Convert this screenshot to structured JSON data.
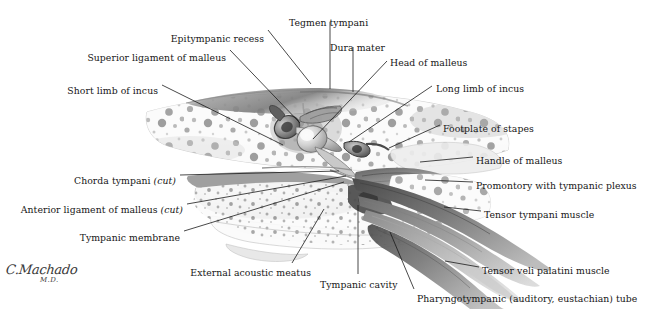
{
  "figure": {
    "background_color": "#ffffff",
    "text_color": "#161616",
    "leader_color": "#1b1b1b"
  },
  "signature": {
    "name": "C.Machado",
    "credential": "M.D."
  },
  "labels": [
    {
      "id": "epitympanic-recess",
      "text": "Epitympanic recess",
      "align": "right-end",
      "x": 264,
      "y": 33,
      "line": [
        [
          268,
          30
        ],
        [
          311,
          84
        ]
      ]
    },
    {
      "id": "tegmen-tympani",
      "text": "Tegmen tympani",
      "align": "left-start",
      "x": 289,
      "y": 17,
      "line": [
        [
          330,
          22
        ],
        [
          330,
          89
        ]
      ]
    },
    {
      "id": "dura-mater",
      "text": "Dura mater",
      "align": "left-start",
      "x": 330,
      "y": 42,
      "line": [
        [
          353,
          47
        ],
        [
          353,
          92
        ]
      ]
    },
    {
      "id": "head-of-malleus",
      "text": "Head of malleus",
      "align": "left-start",
      "x": 390,
      "y": 57,
      "line": [
        [
          387,
          61
        ],
        [
          313,
          139
        ]
      ]
    },
    {
      "id": "superior-ligament-of-malleus",
      "text": "Superior ligament of malleus",
      "align": "right-end",
      "x": 226,
      "y": 52,
      "line": [
        [
          230,
          50
        ],
        [
          300,
          123
        ]
      ]
    },
    {
      "id": "short-limb-of-incus",
      "text": "Short limb of incus",
      "align": "right-end",
      "x": 158,
      "y": 85,
      "line": [
        [
          162,
          85
        ],
        [
          283,
          145
        ]
      ]
    },
    {
      "id": "long-limb-of-incus",
      "text": "Long limb of incus",
      "align": "left-start",
      "x": 436,
      "y": 83,
      "line": [
        [
          432,
          86
        ],
        [
          349,
          142
        ]
      ]
    },
    {
      "id": "footplate-of-stapes",
      "text": "Footplate of stapes",
      "align": "left-start",
      "x": 443,
      "y": 123,
      "line": [
        [
          440,
          125
        ],
        [
          389,
          148
        ]
      ]
    },
    {
      "id": "handle-of-malleus",
      "text": "Handle of malleus",
      "align": "left-start",
      "x": 476,
      "y": 155,
      "line": [
        [
          473,
          157
        ],
        [
          420,
          162
        ]
      ]
    },
    {
      "id": "promontory-with-tympanic-plexus",
      "text": "Promontory with tympanic plexus",
      "align": "left-start",
      "x": 476,
      "y": 180,
      "line": [
        [
          473,
          182
        ],
        [
          425,
          180
        ]
      ]
    },
    {
      "id": "tensor-tympani-muscle",
      "text": "Tensor tympani muscle",
      "align": "left-start",
      "x": 484,
      "y": 209,
      "line": [
        [
          481,
          211
        ],
        [
          444,
          207
        ]
      ]
    },
    {
      "id": "tensor-veli-palatini-muscle",
      "text": "Tensor veli palatini muscle",
      "align": "left-start",
      "x": 482,
      "y": 265,
      "line": [
        [
          479,
          267
        ],
        [
          445,
          261
        ]
      ]
    },
    {
      "id": "pharyngotympanic-tube",
      "text": "Pharyngotympanic (auditory, eustachian) tube",
      "align": "left-start",
      "x": 417,
      "y": 293,
      "line": [
        [
          414,
          289
        ],
        [
          390,
          232
        ]
      ]
    },
    {
      "id": "chorda-tympani-cut",
      "text": "Chorda tympani ",
      "italic": "(cut)",
      "align": "right-end",
      "x": 176,
      "y": 175,
      "line": [
        [
          180,
          175
        ],
        [
          339,
          171
        ]
      ]
    },
    {
      "id": "anterior-ligament-of-malleus-cut",
      "text": "Anterior ligament of malleus ",
      "italic": "(cut)",
      "align": "right-end",
      "x": 183,
      "y": 204,
      "line": [
        [
          187,
          204
        ],
        [
          346,
          176
        ]
      ]
    },
    {
      "id": "tympanic-membrane",
      "text": "Tympanic membrane",
      "align": "right-end",
      "x": 180,
      "y": 232,
      "line": [
        [
          184,
          231
        ],
        [
          344,
          182
        ]
      ]
    },
    {
      "id": "external-acoustic-meatus",
      "text": "External acoustic meatus",
      "align": "right-end",
      "x": 311,
      "y": 267,
      "line": [
        [
          292,
          263
        ],
        [
          324,
          209
        ]
      ]
    },
    {
      "id": "tympanic-cavity",
      "text": "Tympanic cavity",
      "align": "left-start",
      "x": 320,
      "y": 279,
      "line": [
        [
          358,
          274
        ],
        [
          358,
          205
        ]
      ]
    }
  ]
}
